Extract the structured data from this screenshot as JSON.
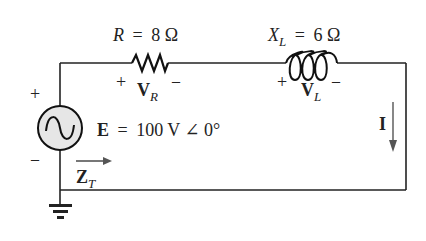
{
  "diagram": {
    "type": "series R-L AC circuit",
    "colors": {
      "wire": "#222222",
      "source_fill": "#e6e6e6",
      "arrow": "#555555",
      "text": "#222222"
    },
    "resistor": {
      "symbol": "R",
      "equals": "=",
      "value": "8 Ω",
      "voltage_symbol": "V",
      "voltage_subscript": "R",
      "plus": "+",
      "minus": "–"
    },
    "inductor": {
      "symbol": "X",
      "symbol_subscript": "L",
      "equals": "=",
      "value": "6 Ω",
      "voltage_symbol": "V",
      "voltage_subscript": "L",
      "plus": "+",
      "minus": "–"
    },
    "source": {
      "symbol": "E",
      "equals": "=",
      "value": "100 V ∠ 0°",
      "plus": "+",
      "minus": "–",
      "icon": "ac-sine-source-icon"
    },
    "current": {
      "symbol": "I",
      "direction": "down"
    },
    "impedance": {
      "symbol": "Z",
      "subscript": "T",
      "direction": "right"
    },
    "ground": {
      "icon": "ground-icon"
    }
  }
}
